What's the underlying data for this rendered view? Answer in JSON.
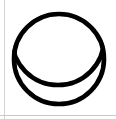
{
  "canvas": {
    "width": 116,
    "height": 119,
    "background_color": "#ffffff"
  },
  "borders": {
    "left_rule_color": "#d4d4d4",
    "bottom_rule_color": "#c9c9c9"
  },
  "figure": {
    "stroke_color": "#000000",
    "fill_color": "none",
    "stroke_width": 4.6,
    "shapes": [
      {
        "name": "outer-circle",
        "type": "circle",
        "cx": 59,
        "cy": 59,
        "r": 45
      },
      {
        "name": "inner-arc-circle",
        "type": "circle",
        "cx": 58,
        "cy": 39,
        "r": 46
      }
    ],
    "intersections": [
      {
        "name": "left-crossing",
        "x": 16,
        "y": 57
      },
      {
        "name": "right-crossing",
        "x": 100,
        "y": 57
      }
    ],
    "extremes": {
      "outer_top_y": 14,
      "outer_bottom_y": 104,
      "outer_left_x": 14,
      "outer_right_x": 104,
      "inner_arc_bottom_y": 85
    }
  }
}
